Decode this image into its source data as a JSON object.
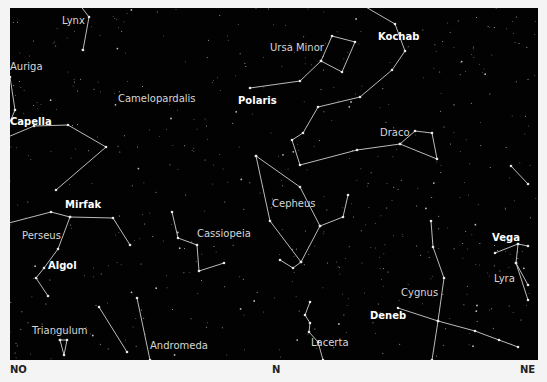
{
  "directions": {
    "left": "NO",
    "center": "N",
    "right": "NE"
  },
  "colors": {
    "sky": "#020202",
    "lines": "#cfcfcf",
    "labels": "#d6d6d6",
    "star_labels": "#ffffff",
    "margin": "#f4f4f4"
  },
  "constellations": [
    {
      "name": "Lynx",
      "x": 62,
      "y": 20,
      "lines": [
        [
          70,
          -8
        ],
        [
          89,
          17
        ],
        [
          83,
          50
        ]
      ]
    },
    {
      "name": "Auriga",
      "x": 10,
      "y": 66,
      "lines": [
        [
          -2,
          70
        ],
        [
          10,
          77
        ],
        [
          15,
          110
        ],
        [
          -2,
          150
        ]
      ]
    },
    {
      "name": "Camelopardalis",
      "x": 118,
      "y": 98,
      "lines": [
        [
          -4,
          142
        ],
        [
          34,
          126
        ],
        [
          68,
          125
        ],
        [
          106,
          147
        ],
        [
          56,
          190
        ]
      ]
    },
    {
      "name": "Ursa Minor",
      "x": 270,
      "y": 47,
      "lines": [
        [
          250,
          88
        ],
        [
          300,
          81
        ],
        [
          321,
          61
        ],
        [
          342,
          72
        ],
        [
          355,
          42
        ],
        [
          332,
          36
        ],
        [
          321,
          61
        ]
      ]
    },
    {
      "name": "Draco",
      "x": 380,
      "y": 132,
      "lines": [
        [
          340,
          -8
        ],
        [
          395,
          24
        ],
        [
          405,
          51
        ],
        [
          392,
          70
        ],
        [
          360,
          97
        ],
        [
          318,
          107
        ],
        [
          303,
          133
        ],
        [
          292,
          140
        ],
        [
          300,
          165
        ],
        [
          357,
          150
        ],
        [
          400,
          144
        ],
        [
          415,
          131
        ],
        [
          432,
          133
        ],
        [
          437,
          159
        ],
        [
          400,
          144
        ]
      ]
    },
    {
      "name": "Cepheus",
      "x": 272,
      "y": 203,
      "lines": [
        [
          256,
          156
        ],
        [
          300,
          187
        ],
        [
          320,
          226
        ],
        [
          343,
          217
        ],
        [
          348,
          195
        ]
      ]
    },
    {
      "name": "Cepheus-lower",
      "x": 0,
      "y": 0,
      "lines": [
        [
          256,
          156
        ],
        [
          270,
          221
        ],
        [
          301,
          262
        ],
        [
          320,
          226
        ]
      ]
    },
    {
      "name": "Cepheus-tail",
      "x": 0,
      "y": 0,
      "lines": [
        [
          301,
          262
        ],
        [
          293,
          268
        ],
        [
          280,
          260
        ]
      ]
    },
    {
      "name": "Perseus",
      "x": 22,
      "y": 235,
      "lines": [
        [
          -2,
          229
        ],
        [
          5,
          224
        ],
        [
          51,
          212
        ],
        [
          70,
          217
        ],
        [
          113,
          218
        ],
        [
          130,
          245
        ]
      ]
    },
    {
      "name": "Perseus-lower",
      "x": 0,
      "y": 0,
      "lines": [
        [
          70,
          217
        ],
        [
          58,
          249
        ],
        [
          44,
          268
        ],
        [
          36,
          278
        ],
        [
          48,
          296
        ]
      ]
    },
    {
      "name": "Cassiopeia",
      "x": 197,
      "y": 233,
      "lines": [
        [
          172,
          212
        ],
        [
          178,
          238
        ],
        [
          197,
          245
        ],
        [
          199,
          271
        ],
        [
          224,
          263
        ]
      ]
    },
    {
      "name": "Triangulum",
      "x": 32,
      "y": 330,
      "lines": [
        [
          60,
          340
        ],
        [
          64,
          355
        ],
        [
          67,
          340
        ],
        [
          60,
          340
        ]
      ]
    },
    {
      "name": "Andromeda",
      "x": 150,
      "y": 345,
      "lines": [
        [
          137,
          298
        ],
        [
          150,
          360
        ]
      ]
    },
    {
      "name": "Andromeda-2",
      "x": 0,
      "y": 0,
      "lines": [
        [
          99,
          307
        ],
        [
          127,
          352
        ]
      ]
    },
    {
      "name": "Lacerta",
      "x": 311,
      "y": 342,
      "lines": [
        [
          310,
          302
        ],
        [
          305,
          315
        ],
        [
          310,
          323
        ],
        [
          309,
          332
        ],
        [
          318,
          342
        ],
        [
          323,
          360
        ]
      ]
    },
    {
      "name": "Cygnus",
      "x": 401,
      "y": 292,
      "lines": [
        [
          431,
          221
        ],
        [
          433,
          247
        ],
        [
          444,
          278
        ],
        [
          438,
          321
        ],
        [
          432,
          360
        ]
      ]
    },
    {
      "name": "Cygnus-wing",
      "x": 0,
      "y": 0,
      "lines": [
        [
          398,
          308
        ],
        [
          438,
          321
        ],
        [
          475,
          331
        ],
        [
          499,
          340
        ],
        [
          518,
          347
        ]
      ]
    },
    {
      "name": "Lyra",
      "x": 494,
      "y": 278,
      "lines": [
        [
          495,
          253
        ],
        [
          518,
          244
        ],
        [
          528,
          246
        ]
      ]
    },
    {
      "name": "Lyra-body",
      "x": 0,
      "y": 0,
      "lines": [
        [
          518,
          244
        ],
        [
          516,
          263
        ],
        [
          528,
          285
        ]
      ]
    },
    {
      "name": "Lyra-edge",
      "x": 0,
      "y": 0,
      "lines": [
        [
          516,
          263
        ],
        [
          528,
          300
        ]
      ]
    },
    {
      "name": "Hercules",
      "x": 0,
      "y": 0,
      "lines": [
        [
          511,
          166
        ],
        [
          528,
          184
        ]
      ]
    }
  ],
  "star_labels": [
    {
      "name": "Kochab",
      "x": 378,
      "y": 36
    },
    {
      "name": "Polaris",
      "x": 238,
      "y": 100
    },
    {
      "name": "Capella",
      "x": 10,
      "y": 121
    },
    {
      "name": "Mirfak",
      "x": 65,
      "y": 204
    },
    {
      "name": "Algol",
      "x": 48,
      "y": 265
    },
    {
      "name": "Vega",
      "x": 492,
      "y": 237
    },
    {
      "name": "Deneb",
      "x": 370,
      "y": 315
    }
  ]
}
